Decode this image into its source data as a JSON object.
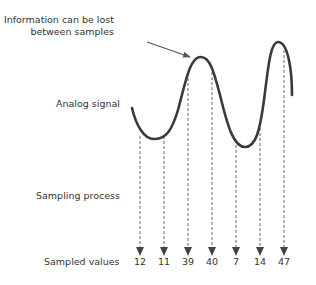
{
  "annotation": {
    "line1": "Information can be lost",
    "line2": "between samples"
  },
  "labels": {
    "analog": "Analog signal",
    "sampling": "Sampling process",
    "sampled": "Sampled values"
  },
  "samples": [
    {
      "x": 140,
      "value": "12"
    },
    {
      "x": 164,
      "value": "11"
    },
    {
      "x": 188,
      "value": "39"
    },
    {
      "x": 212,
      "value": "40"
    },
    {
      "x": 236,
      "value": "7"
    },
    {
      "x": 260,
      "value": "14"
    },
    {
      "x": 284,
      "value": "47"
    }
  ],
  "colors": {
    "curve": "#3a3a3a",
    "arrows": "#444444",
    "annotation_arrow": "#555555"
  }
}
